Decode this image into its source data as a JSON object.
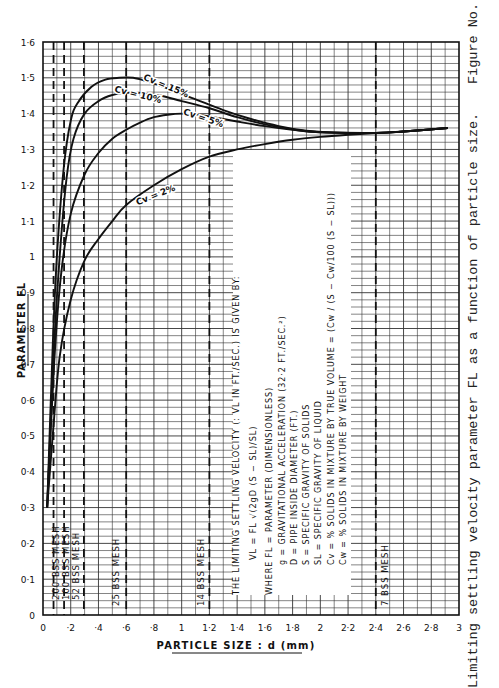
{
  "caption": {
    "text": "Limiting settling velocity parameter FL as a function of particle size.",
    "figure_label": "Figure No."
  },
  "chart_data": {
    "type": "line",
    "title": "",
    "xlabel": "PARTICLE SIZE : d (mm)",
    "ylabel": "PARAMETER FL",
    "xlim": [
      0,
      3
    ],
    "ylim": [
      0,
      1.6
    ],
    "grid": true,
    "x_ticks": [
      "0",
      "·2",
      "·4",
      "·6",
      "·8",
      "1",
      "1·2",
      "1·4",
      "1·6",
      "1·8",
      "2",
      "2·2",
      "2·4",
      "2·6",
      "2·8",
      "3"
    ],
    "x_tick_values": [
      0,
      0.2,
      0.4,
      0.6,
      0.8,
      1.0,
      1.2,
      1.4,
      1.6,
      1.8,
      2.0,
      2.2,
      2.4,
      2.6,
      2.8,
      3.0
    ],
    "y_ticks": [
      "0",
      "0·1",
      "0·2",
      "0·3",
      "0·4",
      "0·5",
      "0·6",
      "0·7",
      "0·8",
      "0·9",
      "1",
      "1·1",
      "1·2",
      "1·3",
      "1·4",
      "1·5",
      "1·6"
    ],
    "y_tick_values": [
      0,
      0.1,
      0.2,
      0.3,
      0.4,
      0.5,
      0.6,
      0.7,
      0.8,
      0.9,
      1.0,
      1.1,
      1.2,
      1.3,
      1.4,
      1.5,
      1.6
    ],
    "series": [
      {
        "name": "Cv = 15%",
        "label_pos": [
          0.88,
          1.47
        ],
        "label_angle": 22,
        "points": [
          [
            0.03,
            0.3
          ],
          [
            0.07,
            0.75
          ],
          [
            0.1,
            1.0
          ],
          [
            0.15,
            1.25
          ],
          [
            0.2,
            1.38
          ],
          [
            0.25,
            1.43
          ],
          [
            0.35,
            1.475
          ],
          [
            0.45,
            1.495
          ],
          [
            0.55,
            1.5
          ],
          [
            0.65,
            1.5
          ],
          [
            0.75,
            1.49
          ],
          [
            0.9,
            1.47
          ],
          [
            1.1,
            1.44
          ],
          [
            1.3,
            1.41
          ],
          [
            1.5,
            1.385
          ],
          [
            1.7,
            1.365
          ],
          [
            1.9,
            1.352
          ],
          [
            2.1,
            1.347
          ],
          [
            2.4,
            1.346
          ],
          [
            2.6,
            1.35
          ],
          [
            2.92,
            1.36
          ]
        ]
      },
      {
        "name": "Cv = 10%",
        "label_pos": [
          0.68,
          1.445
        ],
        "label_angle": 14,
        "points": [
          [
            0.03,
            0.3
          ],
          [
            0.08,
            0.75
          ],
          [
            0.12,
            1.0
          ],
          [
            0.17,
            1.22
          ],
          [
            0.22,
            1.33
          ],
          [
            0.3,
            1.4
          ],
          [
            0.4,
            1.435
          ],
          [
            0.5,
            1.452
          ],
          [
            0.6,
            1.458
          ],
          [
            0.7,
            1.458
          ],
          [
            0.85,
            1.45
          ],
          [
            1.0,
            1.435
          ],
          [
            1.2,
            1.415
          ],
          [
            1.4,
            1.39
          ],
          [
            1.6,
            1.37
          ],
          [
            1.8,
            1.356
          ],
          [
            2.0,
            1.348
          ],
          [
            2.4,
            1.346
          ],
          [
            2.6,
            1.35
          ],
          [
            2.92,
            1.36
          ]
        ]
      },
      {
        "name": "Cv = 5%",
        "label_pos": [
          1.15,
          1.38
        ],
        "label_angle": 18,
        "points": [
          [
            0.03,
            0.3
          ],
          [
            0.08,
            0.7
          ],
          [
            0.13,
            0.95
          ],
          [
            0.2,
            1.12
          ],
          [
            0.3,
            1.23
          ],
          [
            0.4,
            1.29
          ],
          [
            0.5,
            1.33
          ],
          [
            0.6,
            1.355
          ],
          [
            0.7,
            1.375
          ],
          [
            0.8,
            1.39
          ],
          [
            0.9,
            1.397
          ],
          [
            1.0,
            1.4
          ],
          [
            1.1,
            1.398
          ],
          [
            1.2,
            1.392
          ],
          [
            1.4,
            1.378
          ],
          [
            1.6,
            1.365
          ],
          [
            1.8,
            1.355
          ],
          [
            2.0,
            1.348
          ],
          [
            2.4,
            1.346
          ],
          [
            2.6,
            1.35
          ],
          [
            2.92,
            1.36
          ]
        ]
      },
      {
        "name": "Cv = 2%",
        "label_pos": [
          0.82,
          1.165
        ],
        "label_angle": -22,
        "points": [
          [
            0.03,
            0.3
          ],
          [
            0.07,
            0.5
          ],
          [
            0.12,
            0.72
          ],
          [
            0.2,
            0.88
          ],
          [
            0.3,
            0.99
          ],
          [
            0.4,
            1.05
          ],
          [
            0.5,
            1.1
          ],
          [
            0.6,
            1.145
          ],
          [
            0.8,
            1.2
          ],
          [
            1.0,
            1.245
          ],
          [
            1.2,
            1.28
          ],
          [
            1.4,
            1.3
          ],
          [
            1.6,
            1.315
          ],
          [
            1.8,
            1.327
          ],
          [
            2.0,
            1.335
          ],
          [
            2.2,
            1.341
          ],
          [
            2.4,
            1.346
          ],
          [
            2.6,
            1.35
          ],
          [
            2.92,
            1.36
          ]
        ]
      }
    ],
    "reference_lines": [
      {
        "x": 0.076,
        "label": "200 BSS MESH",
        "label_x": 0.09
      },
      {
        "x": 0.152,
        "label": "100 BSS MESH",
        "label_x": 0.16
      },
      {
        "x": 0.295,
        "label": "52 BSS MESH",
        "label_x": 0.23
      },
      {
        "x": 0.6,
        "label": "25 BSS MESH",
        "label_x": 0.52
      },
      {
        "x": 1.2,
        "label": "14 BSS MESH",
        "label_x": 1.13
      },
      {
        "x": 2.4,
        "label": "7 BSS MESH",
        "label_x": 2.46
      }
    ],
    "annotation": {
      "heading": "THE LIMITING SETTLING VELOCITY (: VL IN FT./SEC.) IS GIVEN BY:",
      "formula": "VL = FL √(2gD (S − SL)/SL)",
      "where_lines": [
        "WHERE FL = PARAMETER (DIMENSIONLESS)",
        "g = GRAVITATIONAL ACCELERATION    (32·2 FT./SEC.²)",
        "D = PIPE INSIDE DIAMETER (FT.)",
        "S = SPECIFIC GRAVITY OF SOLIDS",
        "SL = SPECIFIC GRAVITY OF LIQUID",
        "Cv = % SOLIDS IN MIXTURE BY TRUE VOLUME = (Cw / (S − Cw/100 (S − SL)))",
        "Cw = % SOLIDS IN MIXTURE BY WEIGHT"
      ]
    }
  }
}
